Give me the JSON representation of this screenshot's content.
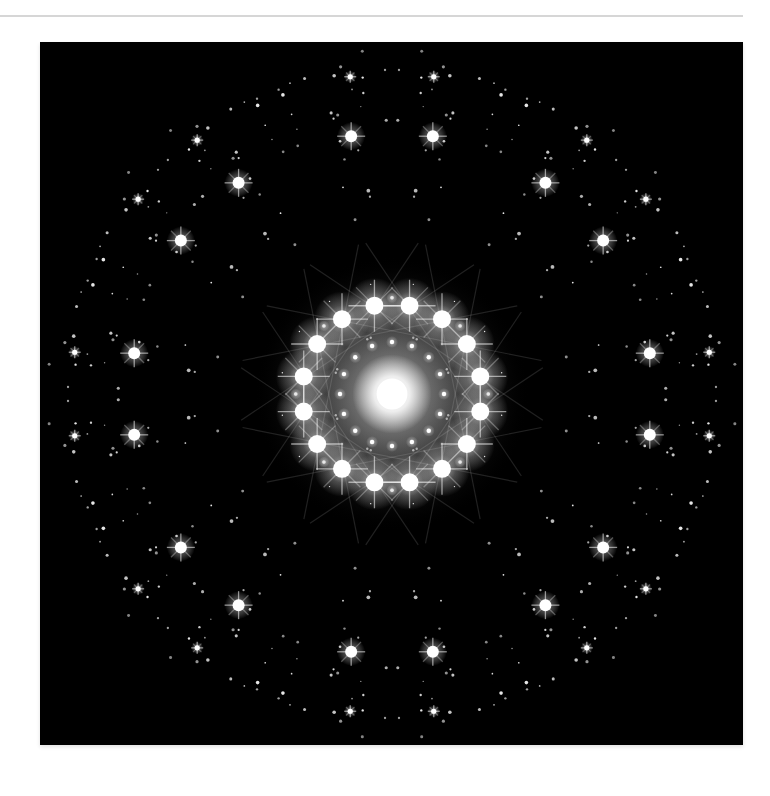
{
  "page": {
    "background": "#ffffff",
    "rule_color": "#d6d6d6"
  },
  "figure": {
    "alt": "Octagonal quasicrystal electron diffraction pattern: bright central spot surrounded by rings of sharp star-like reflections with 8-fold (16-spot) symmetry on a black background",
    "background": "#000000",
    "spot_color": "#ffffff",
    "center": [
      352,
      352
    ],
    "central_glow": {
      "radius": 22,
      "halo_radius": 110
    },
    "rings": [
      {
        "name": "inner",
        "radius": 90,
        "count": 16,
        "offset_deg": 11.25,
        "spot_radius": 9,
        "flare": 26,
        "halo": 28
      },
      {
        "name": "inner-secondary",
        "radius": 52,
        "count": 16,
        "offset_deg": 0,
        "spot_radius": 2.2,
        "flare": 0,
        "halo": 6
      },
      {
        "name": "outer",
        "radius": 261,
        "pairs_around_deg": [
          0,
          45,
          90,
          135,
          180,
          225,
          270,
          315
        ],
        "pair_half_angle_deg": 9,
        "spot_radius": 6,
        "flare": 14,
        "halo": 14
      },
      {
        "name": "far",
        "radius": 320,
        "pairs_around_deg": [
          0,
          45,
          90,
          135,
          180,
          225,
          270,
          315
        ],
        "pair_half_angle_deg": 7.5,
        "spot_radius": 2.6,
        "flare": 6,
        "halo": 6
      }
    ],
    "field": {
      "seed": 7,
      "count_per_sector": 30,
      "min_radius": 60,
      "max_radius": 345,
      "symmetry": 8
    }
  }
}
